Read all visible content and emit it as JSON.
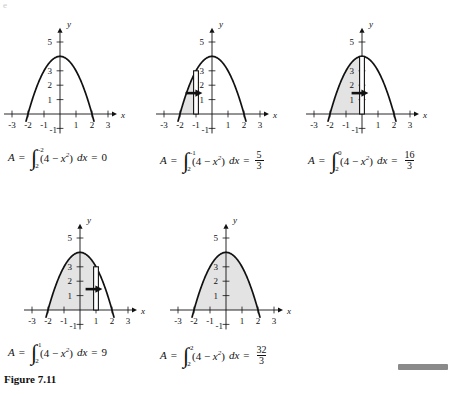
{
  "figure": {
    "caption": "Figure 7.11",
    "caption_position": {
      "x": 4,
      "y": 375
    },
    "corner_artifact": "e",
    "background": "#ffffff",
    "ink_color": "#111111",
    "shade_color": "#e3e3e3",
    "gray_bar_color": "#8a8a8a"
  },
  "chart_data": {
    "type": "line",
    "title": "Figure 7.11",
    "function": "y = 4 - x²",
    "xlabel": "x",
    "ylabel": "y",
    "xlim": [
      -3.6,
      3.6
    ],
    "ylim": [
      -1.4,
      5.9
    ],
    "xticks": [
      -3,
      -2,
      -1,
      1,
      2,
      3
    ],
    "yticks": [
      1,
      2,
      3,
      5,
      -1
    ],
    "ytick_labels": [
      "1",
      "2",
      "3",
      "5",
      "-1"
    ],
    "xtick_labels": [
      "-3",
      "-2",
      "-1",
      "1",
      "2",
      "3"
    ],
    "grid": false,
    "legend": false,
    "panels": [
      {
        "id": "panel-1",
        "upper_limit": "-2",
        "lower_limit": "-2",
        "result": "0",
        "result_is_fraction": false,
        "shade_from": -2,
        "shade_to": -2,
        "has_rect": false,
        "rect_x": null
      },
      {
        "id": "panel-2",
        "upper_limit": "-1",
        "lower_limit": "-2",
        "result_num": "5",
        "result_den": "3",
        "result_is_fraction": true,
        "shade_from": -2,
        "shade_to": -1,
        "has_rect": true,
        "rect_x": -1
      },
      {
        "id": "panel-3",
        "upper_limit": "0",
        "lower_limit": "-2",
        "result_num": "16",
        "result_den": "3",
        "result_is_fraction": true,
        "shade_from": -2,
        "shade_to": 0,
        "has_rect": true,
        "rect_x": 0
      },
      {
        "id": "panel-4",
        "upper_limit": "1",
        "lower_limit": "-2",
        "result": "9",
        "result_is_fraction": false,
        "shade_from": -2,
        "shade_to": 1,
        "has_rect": true,
        "rect_x": 1
      },
      {
        "id": "panel-5",
        "upper_limit": "2",
        "lower_limit": "-2",
        "result_num": "32",
        "result_den": "3",
        "result_is_fraction": true,
        "shade_from": -2,
        "shade_to": 2,
        "has_rect": false,
        "rect_x": null
      }
    ]
  },
  "labels": {
    "A": "A",
    "equals": "=",
    "integrand_open": "(4 − ",
    "integrand_var": "x",
    "integrand_sup": "2",
    "integrand_close": ")",
    "dx": "dx",
    "int_glyph": "∫",
    "x_axis": "x",
    "y_axis": "y"
  },
  "formulas": [
    {
      "name": "formula-1",
      "text": "A = ∫ from -2 to -2 of (4 − x²) dx = 0"
    },
    {
      "name": "formula-2",
      "text": "A = ∫ from -2 to -1 of (4 − x²) dx = 5/3"
    },
    {
      "name": "formula-3",
      "text": "A = ∫ from -2 to 0 of (4 − x²) dx = 16/3"
    },
    {
      "name": "formula-4",
      "text": "A = ∫ from -2 to 1 of (4 − x²) dx = 9"
    },
    {
      "name": "formula-5",
      "text": "A = ∫ from -2 to 2 of (4 − x²) dx = 32/3"
    }
  ]
}
